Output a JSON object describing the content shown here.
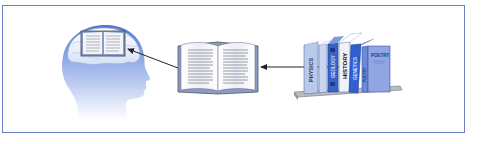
{
  "diagram": {
    "frame_color": "#6b7fc4",
    "nodes": [
      {
        "id": "head",
        "label": "",
        "icon": "head-with-brain-and-book-icon"
      },
      {
        "id": "open-book",
        "label": "",
        "icon": "open-book-icon"
      },
      {
        "id": "bookshelf",
        "label": "",
        "icon": "bookshelf-icon"
      }
    ],
    "edges": [
      {
        "from": "bookshelf",
        "to": "open-book"
      },
      {
        "from": "open-book",
        "to": "head"
      }
    ],
    "books": [
      {
        "title": "PHYSICS",
        "color": "#b9c9ec"
      },
      {
        "title": "",
        "color": "#c8d4f0"
      },
      {
        "title": "GEOLOGY",
        "color": "#3a63c6"
      },
      {
        "title": "HISTORY",
        "color": "#eef2fb"
      },
      {
        "title": "GENETICS",
        "color": "#2f5fd0"
      },
      {
        "title": "POETRY",
        "color": "#8fa6e2"
      }
    ],
    "poetry_cover_text": "POETRY",
    "colors": {
      "head_top": "#5f86d8",
      "head_bottom": "#ffffff",
      "book_page": "#f4f6fc",
      "book_cover": "#8a9bc9",
      "arrow": "#222222",
      "shelf": "#9a9ea8"
    }
  }
}
